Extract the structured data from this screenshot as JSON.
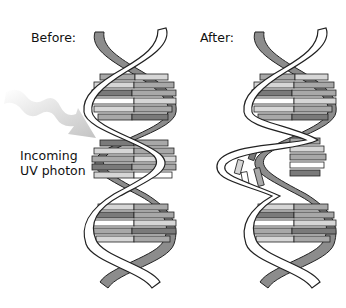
{
  "labels": {
    "before": "Before:",
    "after": "After:",
    "uv_line1": "Incoming",
    "uv_line2": "UV photon"
  },
  "colors": {
    "backbone_back": "#8c8c8c",
    "backbone_front": "#ffffff",
    "outline": "#222222",
    "base_dark": "#7a7a7a",
    "base_mid": "#a8a8a8",
    "base_light": "#d6d6d6",
    "arrow": "#c8c8c8"
  }
}
